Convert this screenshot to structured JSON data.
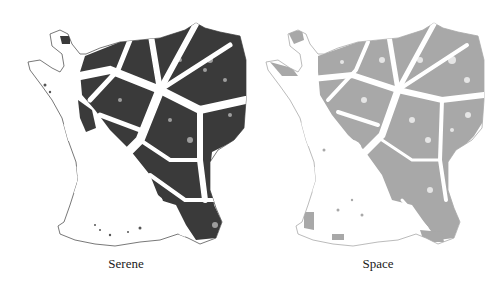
{
  "figure": {
    "panels": [
      {
        "caption": "Serene",
        "fill_color": "#3a3a3a",
        "outline_color": "#555555"
      },
      {
        "caption": "Space",
        "fill_color": "#a8a8a8",
        "outline_color": "#aaaaaa"
      }
    ]
  }
}
